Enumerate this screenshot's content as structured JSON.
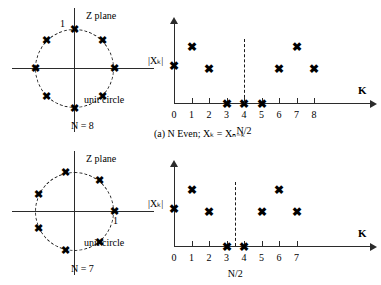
{
  "figure": {
    "panels": [
      {
        "id": "a",
        "caption": "(a)  N Even; Xₖ = Xₙ₋ₖ",
        "zplane": {
          "title": "Z plane",
          "unit_circle_label": "unit circle",
          "n_label": "N = 8",
          "reference_point_label": "1",
          "reference_point_position": "top",
          "num_roots": 8,
          "start_angle_deg": 90
        },
        "chart_data": {
          "type": "scatter",
          "title": "",
          "xlabel": "K",
          "ylabel": "|Xₖ|",
          "categories": [
            "0",
            "1",
            "2",
            "3",
            "4",
            "5",
            "6",
            "7",
            "8"
          ],
          "x": [
            0,
            1,
            2,
            3,
            4,
            5,
            6,
            7,
            8
          ],
          "values": [
            2,
            3,
            1.85,
            0,
            0,
            0,
            1.85,
            3,
            1.85
          ],
          "ylim": [
            0,
            4
          ],
          "xlim": [
            0,
            9.6
          ],
          "grid": false,
          "legend": null,
          "annotations": [
            {
              "text": "N/2",
              "x": 4,
              "type": "dashed-vline"
            }
          ]
        }
      },
      {
        "id": "b",
        "caption": "(b)  N Odd; Xₖ = Xₙ−ₖ",
        "zplane": {
          "title": "Z plane",
          "unit_circle_label": "unit circle",
          "n_label": "N = 7",
          "reference_point_label": "1",
          "reference_point_position": "right",
          "num_roots": 7,
          "start_angle_deg": 0
        },
        "chart_data": {
          "type": "scatter",
          "title": "",
          "xlabel": "K",
          "ylabel": "|Xₖ|",
          "categories": [
            "0",
            "1",
            "2",
            "3",
            "4",
            "5",
            "6",
            "7"
          ],
          "x": [
            0,
            1,
            2,
            3,
            4,
            5,
            6,
            7
          ],
          "values": [
            2,
            3,
            1.85,
            0,
            0,
            1.85,
            3,
            1.85
          ],
          "ylim": [
            0,
            4
          ],
          "xlim": [
            0,
            9.6
          ],
          "grid": false,
          "legend": null,
          "annotations": [
            {
              "text": "N/2",
              "x": 3.5,
              "type": "dashed-vline"
            }
          ]
        }
      }
    ]
  }
}
